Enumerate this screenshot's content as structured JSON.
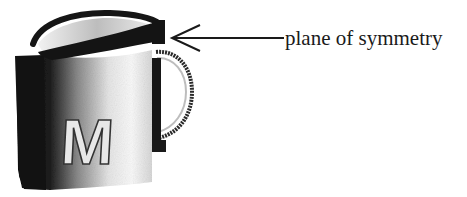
{
  "figure": {
    "type": "illustration",
    "mug_letter": "M",
    "annotation": {
      "label": "plane of symmetry",
      "pointer": "arrow pointing left to the dark slab that cuts the mug in half"
    },
    "colors": {
      "ink": "#1a1a1a",
      "mug_dark": "#141414",
      "mug_light": "#f4f4f4",
      "background": "#ffffff"
    }
  }
}
